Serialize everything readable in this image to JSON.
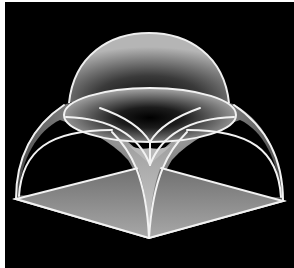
{
  "figure": {
    "colors": {
      "background": "#000000",
      "frame": "#ffffff",
      "edge": "#f2f2f2",
      "base_fill": "#8a8a8a",
      "surface_light": "#c8c8c8",
      "surface_dark": "#1a1a1a"
    },
    "parts": [
      "dome-cap",
      "ring-ellipse",
      "pendentives",
      "arch-faces",
      "square-base"
    ]
  }
}
